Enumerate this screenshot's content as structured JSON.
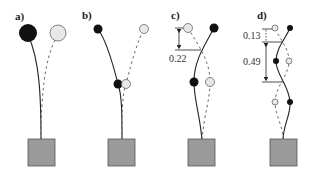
{
  "figure": {
    "panels": [
      {
        "id": "a",
        "label": "a)",
        "annotations": []
      },
      {
        "id": "b",
        "label": "b)",
        "annotations": []
      },
      {
        "id": "c",
        "label": "c)",
        "annotations": [
          {
            "label": "0.22"
          }
        ]
      },
      {
        "id": "d",
        "label": "d)",
        "annotations": [
          {
            "label": "0.13"
          },
          {
            "label": "0.49"
          }
        ]
      }
    ],
    "colors": {
      "mass_filled": "#111111",
      "mass_open": "#e8e8e8",
      "base": "#9a9a9a",
      "line": "#222222"
    }
  }
}
